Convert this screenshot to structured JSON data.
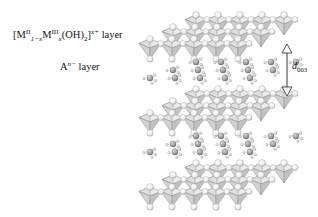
{
  "figure": {
    "background_color": "#ffffff",
    "width": 318,
    "height": 217
  },
  "labels": {
    "layer_formula": {
      "prefix": "[M",
      "m2_superscript": "II",
      "m2_subscript": "1−x",
      "m3_element": "M",
      "m3_superscript": "III",
      "m3_subscript": "x",
      "hydroxide": "(OH)",
      "hydroxide_subscript": "2",
      "bracket_close": "]",
      "charge_superscript": "x+",
      "suffix": " layer"
    },
    "anion_layer": {
      "element": "A",
      "charge_superscript": "n−",
      "suffix": " layer"
    },
    "d_spacing": {
      "symbol": "d",
      "subscript": "003"
    }
  },
  "colors": {
    "polyhedron_fill": "#d9d9d9",
    "polyhedron_fill_light": "#ebebeb",
    "polyhedron_fill_dark": "#c4c4c4",
    "polyhedron_edge": "#8a8a8a",
    "sphere_light": "#fbfbfb",
    "sphere_edge": "#9a9a9a",
    "anion_sphere": "#9e9e9e",
    "water_sphere": "#cfcfcf",
    "arrow_stroke": "#3a3a3a",
    "text": "#141414"
  },
  "structure": {
    "slab_count": 3,
    "interlayer_count": 2,
    "octahedra_per_row": 4,
    "rows_per_slab": 3,
    "projection": "isometric",
    "slab_origins_y": [
      22,
      98,
      168
    ],
    "interlayer_origins_y": [
      68,
      142
    ],
    "anion_clusters_per_interlayer": 5
  }
}
